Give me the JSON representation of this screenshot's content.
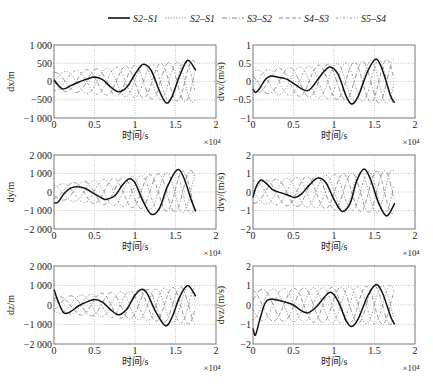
{
  "figure": {
    "legend": [
      {
        "label": "S2–S1",
        "style": "solid",
        "color": "#111111"
      },
      {
        "label": "S2–S1",
        "style": "dotted",
        "color": "#888888"
      },
      {
        "label": "S3–S2",
        "style": "dashdot",
        "color": "#888888"
      },
      {
        "label": "S4–S3",
        "style": "dashed",
        "color": "#888888"
      },
      {
        "label": "S5–S4",
        "style": "dashdot2",
        "color": "#999999"
      }
    ],
    "colors": {
      "main": "#111111",
      "secondary": "#8a8a8a",
      "grid": "#9a9a9a",
      "frame": "#555555"
    }
  },
  "chart_data": [
    {
      "type": "line",
      "id": "dx",
      "ylabel": "dx/m",
      "xlabel": "时间/s",
      "x_multiplier": "×10⁴",
      "xlim": [
        0,
        2
      ],
      "ylim": [
        -1000,
        1000
      ],
      "xticks": [
        0,
        0.5,
        1,
        1.5,
        2
      ],
      "xtick_labels": [
        "0",
        "0.5",
        "1",
        "1.5",
        "2"
      ],
      "yticks": [
        -1000,
        -500,
        0,
        500,
        1000
      ],
      "ytick_labels": [
        "−1 000",
        "−500",
        "0",
        "500",
        "1 000"
      ],
      "grid": true,
      "series": [
        {
          "name": "S2–S1",
          "style": "solid",
          "x": [
            0,
            0.05,
            0.1,
            0.15,
            0.2,
            0.3,
            0.4,
            0.5,
            0.6,
            0.7,
            0.8,
            0.9,
            1.0,
            1.1,
            1.2,
            1.3,
            1.38,
            1.45,
            1.55,
            1.65,
            1.75
          ],
          "y": [
            50,
            -100,
            -200,
            -180,
            -120,
            -20,
            60,
            120,
            50,
            -150,
            -280,
            -150,
            200,
            470,
            300,
            -250,
            -580,
            -450,
            150,
            580,
            300
          ]
        }
      ],
      "envelope": {
        "x_end": 1.75,
        "amp_start": 250,
        "amp_end": 580,
        "lines": 4
      }
    },
    {
      "type": "line",
      "id": "dvx",
      "ylabel": "dvx/(m/s)",
      "xlabel": "时间/s",
      "x_multiplier": "×10⁴",
      "xlim": [
        0,
        2
      ],
      "ylim": [
        -1,
        1
      ],
      "xticks": [
        0,
        0.5,
        1,
        1.5,
        2
      ],
      "xtick_labels": [
        "0",
        "0.5",
        "1",
        "1.5",
        "2"
      ],
      "yticks": [
        -1,
        -0.5,
        0,
        0.5,
        1
      ],
      "ytick_labels": [
        "−1",
        "−0.5",
        "0",
        "0.5",
        "1"
      ],
      "grid": true,
      "series": [
        {
          "name": "S2–S1",
          "style": "solid",
          "x": [
            0,
            0.03,
            0.08,
            0.15,
            0.22,
            0.3,
            0.4,
            0.5,
            0.6,
            0.68,
            0.75,
            0.85,
            0.95,
            1.05,
            1.15,
            1.22,
            1.3,
            1.42,
            1.52,
            1.6,
            1.7,
            1.75
          ],
          "y": [
            -0.2,
            -0.3,
            -0.2,
            0.05,
            0.15,
            0.12,
            0.08,
            -0.05,
            -0.2,
            -0.25,
            -0.1,
            0.2,
            0.4,
            0.2,
            -0.4,
            -0.62,
            -0.4,
            0.3,
            0.62,
            0.3,
            -0.4,
            -0.58
          ]
        }
      ],
      "envelope": {
        "x_end": 1.75,
        "amp_start": 0.3,
        "amp_end": 0.62,
        "lines": 4
      }
    },
    {
      "type": "line",
      "id": "dy",
      "ylabel": "dy/m",
      "xlabel": "时间/s",
      "x_multiplier": "×10⁴",
      "xlim": [
        0,
        2
      ],
      "ylim": [
        -2000,
        2000
      ],
      "xticks": [
        0,
        0.5,
        1,
        1.5,
        2
      ],
      "xtick_labels": [
        "0",
        "0.5",
        "1",
        "1.5",
        "2"
      ],
      "yticks": [
        -2000,
        -1000,
        0,
        1000,
        2000
      ],
      "ytick_labels": [
        "−2 000",
        "−1 000",
        "0",
        "1 000",
        "2 000"
      ],
      "grid": true,
      "series": [
        {
          "name": "S2–S1",
          "style": "solid",
          "x": [
            0,
            0.05,
            0.12,
            0.2,
            0.28,
            0.38,
            0.5,
            0.6,
            0.65,
            0.75,
            0.85,
            0.93,
            1.0,
            1.1,
            1.2,
            1.3,
            1.4,
            1.52,
            1.6,
            1.7,
            1.75
          ],
          "y": [
            -600,
            -550,
            -100,
            200,
            280,
            200,
            -100,
            -350,
            -400,
            -200,
            400,
            720,
            500,
            -500,
            -1200,
            -900,
            300,
            1200,
            800,
            -500,
            -1050
          ]
        }
      ],
      "envelope": {
        "x_end": 1.75,
        "amp_start": 400,
        "amp_end": 1200,
        "lines": 4
      }
    },
    {
      "type": "line",
      "id": "dvy",
      "ylabel": "dvy/(m/s)",
      "xlabel": "时间/s",
      "x_multiplier": "×10⁴",
      "xlim": [
        0,
        2
      ],
      "ylim": [
        -2,
        2
      ],
      "xticks": [
        0,
        0.5,
        1,
        1.5,
        2
      ],
      "xtick_labels": [
        "0",
        "0.5",
        "1",
        "1.5",
        "2"
      ],
      "yticks": [
        -2,
        -1,
        0,
        1,
        2
      ],
      "ytick_labels": [
        "−2",
        "−1",
        "0",
        "1",
        "2"
      ],
      "grid": true,
      "series": [
        {
          "name": "S2–S1",
          "style": "solid",
          "x": [
            0,
            0.04,
            0.1,
            0.18,
            0.25,
            0.35,
            0.45,
            0.52,
            0.6,
            0.7,
            0.8,
            0.9,
            1.0,
            1.1,
            1.2,
            1.28,
            1.37,
            1.45,
            1.55,
            1.65,
            1.75
          ],
          "y": [
            -0.3,
            0.3,
            0.65,
            0.4,
            0.1,
            -0.05,
            -0.2,
            -0.3,
            -0.1,
            0.4,
            0.75,
            0.5,
            -0.4,
            -1.05,
            -0.6,
            0.6,
            1.25,
            0.7,
            -0.6,
            -1.3,
            -0.6
          ]
        }
      ],
      "envelope": {
        "x_end": 1.75,
        "amp_start": 0.6,
        "amp_end": 1.2,
        "lines": 4
      }
    },
    {
      "type": "line",
      "id": "dz",
      "ylabel": "dz/m",
      "xlabel": "时间/s",
      "x_multiplier": "×10⁴",
      "xlim": [
        0,
        2
      ],
      "ylim": [
        -2000,
        2000
      ],
      "xticks": [
        0,
        0.5,
        1,
        1.5,
        2
      ],
      "xtick_labels": [
        "0",
        "0.5",
        "1",
        "1.5",
        "2"
      ],
      "yticks": [
        -2000,
        -1000,
        0,
        1000,
        2000
      ],
      "ytick_labels": [
        "−2 000",
        "−1 000",
        "0",
        "1 000",
        "2 000"
      ],
      "grid": true,
      "series": [
        {
          "name": "S2–S1",
          "style": "solid",
          "x": [
            0,
            0.05,
            0.12,
            0.2,
            0.3,
            0.4,
            0.5,
            0.6,
            0.7,
            0.8,
            0.9,
            1.0,
            1.08,
            1.15,
            1.25,
            1.37,
            1.45,
            1.55,
            1.65,
            1.75
          ],
          "y": [
            800,
            200,
            -400,
            -350,
            -50,
            150,
            280,
            150,
            -250,
            -500,
            -200,
            500,
            800,
            600,
            -300,
            -1050,
            -700,
            400,
            1000,
            450
          ]
        }
      ],
      "envelope": {
        "x_end": 1.75,
        "amp_start": 400,
        "amp_end": 1000,
        "lines": 4
      }
    },
    {
      "type": "line",
      "id": "dvz",
      "ylabel": "dvz/(m/s)",
      "xlabel": "时间/s",
      "x_multiplier": "×10⁴",
      "xlim": [
        0,
        2
      ],
      "ylim": [
        -2,
        2
      ],
      "xticks": [
        0,
        0.5,
        1,
        1.5,
        2
      ],
      "xtick_labels": [
        "0",
        "0.5",
        "1",
        "1.5",
        "2"
      ],
      "yticks": [
        -2,
        -1,
        0,
        1,
        2
      ],
      "ytick_labels": [
        "−2",
        "−1",
        "0",
        "1",
        "2"
      ],
      "grid": true,
      "series": [
        {
          "name": "S2–S1",
          "style": "solid",
          "x": [
            0,
            0.03,
            0.08,
            0.15,
            0.22,
            0.3,
            0.4,
            0.5,
            0.6,
            0.68,
            0.78,
            0.88,
            0.96,
            1.05,
            1.15,
            1.22,
            1.3,
            1.42,
            1.52,
            1.6,
            1.7,
            1.75
          ],
          "y": [
            -1.2,
            -1.55,
            -0.8,
            0.1,
            0.3,
            0.25,
            0.15,
            0.0,
            -0.3,
            -0.4,
            -0.1,
            0.4,
            0.65,
            0.2,
            -0.8,
            -1.1,
            -0.7,
            0.5,
            1.05,
            0.6,
            -0.6,
            -1.0
          ]
        }
      ],
      "envelope": {
        "x_end": 1.75,
        "amp_start": 0.8,
        "amp_end": 1.0,
        "lines": 4
      }
    }
  ]
}
